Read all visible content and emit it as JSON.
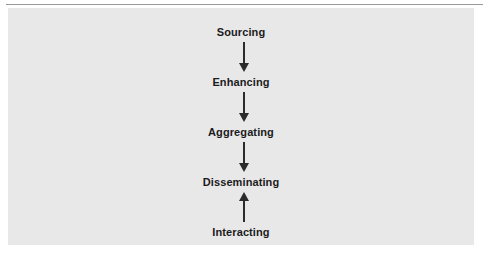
{
  "figure": {
    "background_color": "#e8e8e9",
    "page_color": "#ffffff",
    "rule_color": "#9a9a9d",
    "text_color": "#1b1b1b",
    "arrow_color": "#2b2b2b"
  },
  "diagram": {
    "type": "flowchart",
    "orientation": "vertical",
    "nodes": [
      {
        "id": "sourcing",
        "label": "Sourcing"
      },
      {
        "id": "enhancing",
        "label": "Enhancing"
      },
      {
        "id": "aggregating",
        "label": "Aggregating"
      },
      {
        "id": "disseminating",
        "label": "Disseminating"
      },
      {
        "id": "interacting",
        "label": "Interacting"
      }
    ],
    "edges": [
      {
        "from": "sourcing",
        "to": "enhancing",
        "direction": "down"
      },
      {
        "from": "enhancing",
        "to": "aggregating",
        "direction": "down"
      },
      {
        "from": "aggregating",
        "to": "disseminating",
        "direction": "down"
      },
      {
        "from": "interacting",
        "to": "disseminating",
        "direction": "up"
      }
    ]
  }
}
